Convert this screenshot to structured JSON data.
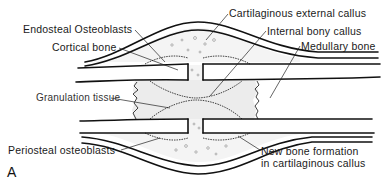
{
  "figure": {
    "panel_label": "A",
    "structures": {
      "cortical_bone": "cortical-bone",
      "medullary_bone": "medullary-bone",
      "fracture_gap": "fracture-gap",
      "callus": "external-callus"
    }
  },
  "labels": {
    "endosteal_osteoblasts": "Endosteal Osteoblasts",
    "cortical_bone": "Cortical bone",
    "cartilaginous_external_callus": "Cartilaginous external callus",
    "internal_bony_callus": "Internal bony callus",
    "medullary_bone": "Medullary bone",
    "granulation_tissue": "Granulation tissue",
    "periosteal_osteoblasts": "Periosteal osteoblasts",
    "new_bone_formation_line1": "New bone formation",
    "new_bone_formation_line2": "in cartilaginous callus"
  },
  "colors": {
    "ink": "#111111",
    "background": "#ffffff",
    "cartilage_fill": "#f4f4f4",
    "granulation_fill": "#ececec"
  }
}
